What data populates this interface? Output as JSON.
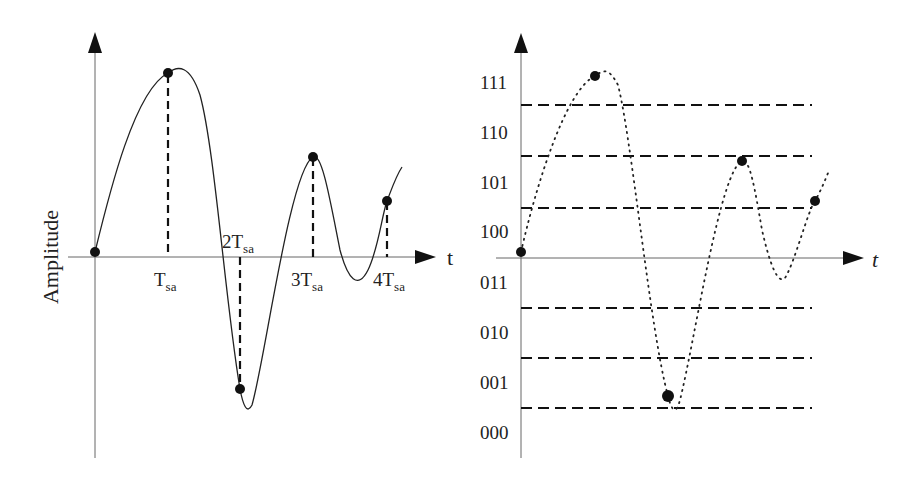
{
  "left_panel": {
    "y_axis_label": "Amplitude",
    "x_axis_label": "t",
    "ticks": [
      {
        "main": "T",
        "sub": "sa"
      },
      {
        "main": "2T",
        "sub": "sa"
      },
      {
        "main": "3T",
        "sub": "sa"
      },
      {
        "main": "4T",
        "sub": "sa"
      }
    ],
    "description": "Continuous analog signal sampled at multiples of T_sa"
  },
  "right_panel": {
    "x_axis_label": "t",
    "levels": [
      "111",
      "110",
      "101",
      "100",
      "011",
      "010",
      "001",
      "000"
    ],
    "description": "Sampled signal quantized into 3-bit levels"
  },
  "colors": {
    "line": "#111111",
    "axis": "#555555",
    "text": "#222222",
    "background": "#ffffff"
  }
}
